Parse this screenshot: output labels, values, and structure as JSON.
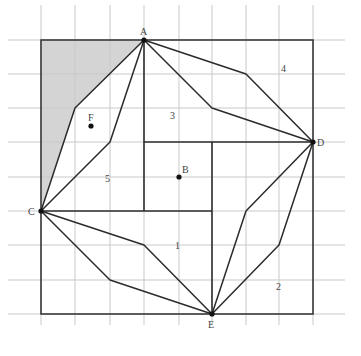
{
  "diagram": {
    "title": "",
    "grid": {
      "x": [
        41,
        75,
        110,
        144,
        179,
        212,
        246,
        279,
        313
      ],
      "y": [
        40,
        74,
        108,
        142,
        177,
        211,
        245,
        280,
        314
      ],
      "extend_left": 8,
      "extend_right": 345,
      "extend_top": 5,
      "extend_bottom": 325
    },
    "points": {
      "A": {
        "label": "A",
        "x": 144,
        "y": 40
      },
      "B": {
        "label": "B",
        "x": 179,
        "y": 177
      },
      "C": {
        "label": "C",
        "x": 41,
        "y": 211
      },
      "D": {
        "label": "D",
        "x": 313,
        "y": 142
      },
      "E": {
        "label": "E",
        "x": 212,
        "y": 314
      },
      "F": {
        "label": "F",
        "x": 91,
        "y": 126
      }
    },
    "regions": {
      "r1": "1",
      "r2": "2",
      "r3": "3",
      "r4": "4",
      "r5": "5"
    },
    "colors": {
      "shade": "#d4d4d4",
      "line": "#2b2b2b",
      "grid": "#c9c9c9"
    }
  }
}
